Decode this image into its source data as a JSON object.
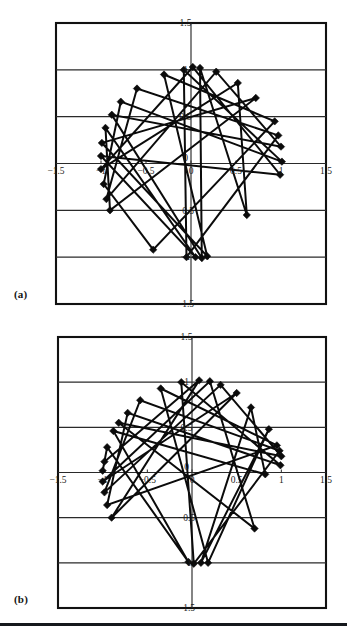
{
  "figure": {
    "panels": [
      {
        "id": "a",
        "label": "(a)"
      },
      {
        "id": "b",
        "label": "(b)"
      }
    ]
  },
  "axes": {
    "x_ticks": [
      "-1.5",
      "-1",
      "-0.5",
      "0",
      "0.5",
      "1",
      "1.5"
    ],
    "y_ticks": [
      "1.5",
      "1",
      "0.5",
      "0",
      "-0.5",
      "-1",
      "-1.5"
    ],
    "xlim": [
      -1.5,
      1.5
    ],
    "ylim": [
      -1.5,
      1.5
    ]
  },
  "chart_data": [
    {
      "type": "scatter",
      "id": "a",
      "title": "",
      "subtitle": "",
      "xlabel": "",
      "ylabel": "",
      "panel_label": "(a)",
      "xlim": [
        -1.5,
        1.5
      ],
      "ylim": [
        -1.5,
        1.5
      ],
      "xticks": [
        -1.5,
        -1,
        -0.5,
        0,
        0.5,
        1,
        1.5
      ],
      "yticks": [
        -1.5,
        -1,
        -0.5,
        0,
        0.5,
        1,
        1.5
      ],
      "xticklabels": [
        "-1.5",
        "-1",
        "-0.5",
        "0",
        "0.5",
        "1",
        "1.5"
      ],
      "yticklabels": [
        "-1.5",
        "-1",
        "-0.5",
        "0",
        "0.5",
        "1",
        "1.5"
      ],
      "grid": true,
      "grid_axis": "y",
      "legend": "none",
      "marker": "diamond",
      "connected": true,
      "series": [
        {
          "name": "series-a",
          "points": [
            [
              0.02,
              1.03
            ],
            [
              0.1,
              1.02
            ],
            [
              -0.08,
              1.0
            ],
            [
              0.28,
              0.98
            ],
            [
              -0.3,
              0.95
            ],
            [
              0.52,
              0.86
            ],
            [
              -0.6,
              0.8
            ],
            [
              0.72,
              0.7
            ],
            [
              -0.78,
              0.66
            ],
            [
              -0.88,
              0.52
            ],
            [
              0.93,
              0.45
            ],
            [
              -0.95,
              0.38
            ],
            [
              0.97,
              0.3
            ],
            [
              -0.99,
              0.22
            ],
            [
              1.0,
              0.18
            ],
            [
              -1.0,
              0.08
            ],
            [
              1.01,
              0.02
            ],
            [
              -1.0,
              -0.06
            ],
            [
              0.99,
              -0.12
            ],
            [
              -0.97,
              -0.22
            ],
            [
              -0.94,
              -0.38
            ],
            [
              -0.9,
              -0.5
            ],
            [
              0.62,
              -0.55
            ],
            [
              -0.42,
              -0.92
            ],
            [
              0.05,
              -1.0
            ],
            [
              0.12,
              -1.01
            ],
            [
              -0.05,
              -1.0
            ],
            [
              0.18,
              -0.99
            ]
          ],
          "path_order": [
            0,
            17,
            5,
            22,
            1,
            25,
            9,
            14,
            3,
            20,
            6,
            12,
            26,
            2,
            16,
            8,
            19,
            23,
            10,
            4,
            27,
            13,
            7,
            21,
            11,
            24,
            15,
            18,
            0
          ]
        }
      ]
    },
    {
      "type": "scatter",
      "id": "b",
      "title": "",
      "subtitle": "",
      "xlabel": "",
      "ylabel": "",
      "panel_label": "(b)",
      "xlim": [
        -1.5,
        1.5
      ],
      "ylim": [
        -1.5,
        1.5
      ],
      "xticks": [
        -1.5,
        -1,
        -0.5,
        0,
        0.5,
        1,
        1.5
      ],
      "yticks": [
        -1.5,
        -1,
        -0.5,
        0,
        0.5,
        1,
        1.5
      ],
      "xticklabels": [
        "-1.5",
        "-1",
        "-0.5",
        "0",
        "0.5",
        "1",
        "1.5"
      ],
      "yticklabels": [
        "-1.5",
        "-1",
        "-0.5",
        "0",
        "0.5",
        "1",
        "1.5"
      ],
      "grid": true,
      "grid_axis": "y",
      "legend": "none",
      "marker": "diamond",
      "connected": true,
      "series": [
        {
          "name": "series-b",
          "points": [
            [
              0.08,
              1.02
            ],
            [
              0.2,
              1.01
            ],
            [
              -0.12,
              1.0
            ],
            [
              0.32,
              0.97
            ],
            [
              -0.35,
              0.93
            ],
            [
              0.5,
              0.88
            ],
            [
              -0.58,
              0.8
            ],
            [
              0.66,
              0.72
            ],
            [
              -0.72,
              0.66
            ],
            [
              -0.82,
              0.55
            ],
            [
              0.86,
              0.48
            ],
            [
              -0.88,
              0.46
            ],
            [
              0.95,
              0.3
            ],
            [
              -0.95,
              0.28
            ],
            [
              0.98,
              0.24
            ],
            [
              -0.98,
              0.12
            ],
            [
              1.0,
              0.18
            ],
            [
              -1.0,
              0.02
            ],
            [
              0.99,
              0.08
            ],
            [
              -1.0,
              -0.1
            ],
            [
              0.82,
              -0.02
            ],
            [
              -0.98,
              -0.22
            ],
            [
              -0.95,
              -0.36
            ],
            [
              -0.9,
              -0.5
            ],
            [
              0.7,
              -0.62
            ],
            [
              0.1,
              -1.0
            ],
            [
              0.02,
              -1.01
            ],
            [
              0.18,
              -1.0
            ],
            [
              -0.04,
              -0.99
            ]
          ],
          "path_order": [
            0,
            23,
            5,
            19,
            1,
            24,
            9,
            16,
            3,
            21,
            6,
            14,
            26,
            2,
            18,
            8,
            22,
            12,
            4,
            27,
            10,
            25,
            7,
            20,
            11,
            28,
            13,
            17,
            15,
            0
          ]
        }
      ]
    }
  ]
}
